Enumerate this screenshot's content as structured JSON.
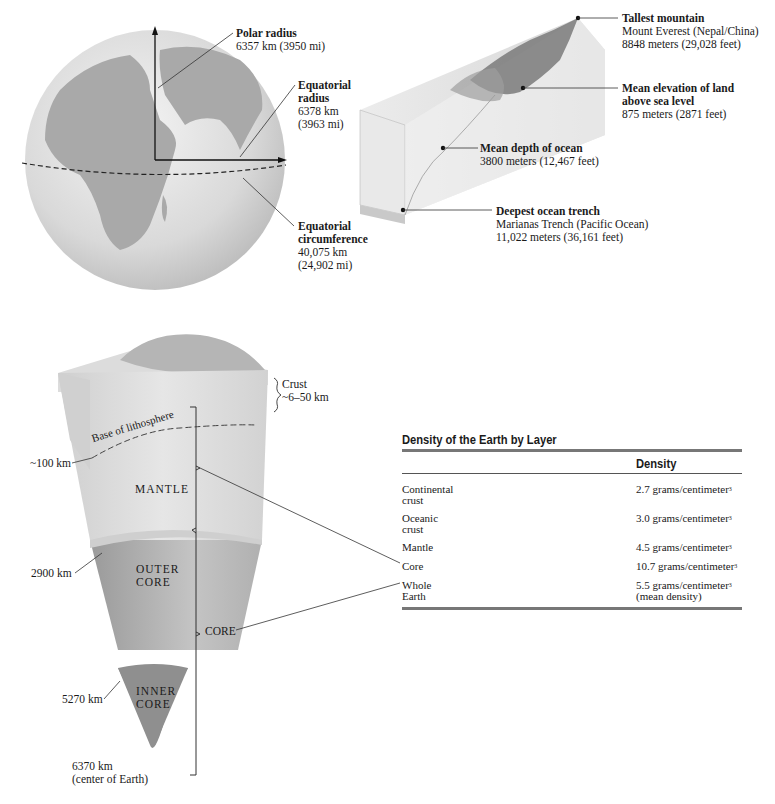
{
  "globe": {
    "polar_radius": {
      "title": "Polar radius",
      "value": "6357 km (3950 mi)"
    },
    "equatorial_radius": {
      "title_1": "Equatorial",
      "title_2": "radius",
      "value_1": "6378 km",
      "value_2": "(3963 mi)"
    },
    "equatorial_circumference": {
      "title_1": "Equatorial",
      "title_2": "circumference",
      "value_1": "40,075 km",
      "value_2": "(24,902 mi)"
    }
  },
  "relief": {
    "tallest_mountain": {
      "title": "Tallest mountain",
      "line1": "Mount Everest (Nepal/China)",
      "line2": "8848 meters (29,028 feet)"
    },
    "mean_elevation": {
      "title_1": "Mean elevation of land",
      "title_2": "above sea level",
      "line1": "875 meters (2871 feet)"
    },
    "mean_depth": {
      "title": "Mean depth of ocean",
      "line1": "3800 meters (12,467 feet)"
    },
    "deepest_trench": {
      "title": "Deepest ocean trench",
      "line1": "Marianas Trench (Pacific Ocean)",
      "line2": "11,022 meters (36,161 feet)"
    }
  },
  "cross_section": {
    "crust": {
      "label": "Crust",
      "range": "~6–50 km"
    },
    "lithosphere_base": "Base of lithosphere",
    "depth_100": "~100 km",
    "mantle": "MANTLE",
    "depth_2900": "2900 km",
    "outer_core_1": "OUTER",
    "outer_core_2": "CORE",
    "core": "CORE",
    "depth_5270": "5270 km",
    "inner_core_1": "INNER",
    "inner_core_2": "CORE",
    "depth_6370": "6370 km",
    "center": "(center of Earth)"
  },
  "density_table": {
    "title": "Density of the Earth by Layer",
    "column_header": "Density",
    "rows": [
      {
        "layer_1": "Continental",
        "layer_2": "crust",
        "density": "2.7 grams/centimeter",
        "note": ""
      },
      {
        "layer_1": "Oceanic",
        "layer_2": "crust",
        "density": "3.0 grams/centimeter",
        "note": ""
      },
      {
        "layer_1": "Mantle",
        "layer_2": "",
        "density": "4.5 grams/centimeter",
        "note": ""
      },
      {
        "layer_1": "Core",
        "layer_2": "",
        "density": "10.7 grams/centimeter",
        "note": ""
      },
      {
        "layer_1": "Whole",
        "layer_2": "Earth",
        "density": "5.5 grams/centimeter",
        "note": "(mean density)"
      }
    ],
    "superscript": "3"
  }
}
